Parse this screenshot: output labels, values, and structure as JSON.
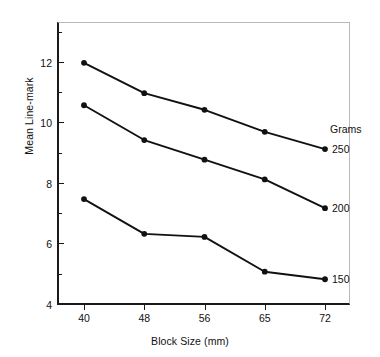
{
  "chart_data": {
    "type": "line",
    "title": "",
    "xlabel": "Block Size (mm)",
    "ylabel": "Mean Line-mark",
    "categories": [
      "40",
      "48",
      "56",
      "65",
      "72"
    ],
    "x_numeric": [
      40,
      48,
      56,
      65,
      72
    ],
    "xlim": [
      0,
      4
    ],
    "ylim": [
      4,
      13.35
    ],
    "grid": false,
    "legend_position": "right-inline",
    "legend_title": "Grams",
    "y_major_ticks": [
      "4",
      "6",
      "8",
      "10",
      "12"
    ],
    "y_minor_ticks": [
      "5",
      "7",
      "9",
      "11",
      "13"
    ],
    "series": [
      {
        "name": "250",
        "values": [
          12.0,
          11.0,
          10.45,
          9.72,
          9.15
        ]
      },
      {
        "name": "200",
        "values": [
          10.6,
          9.45,
          8.8,
          8.15,
          7.2
        ]
      },
      {
        "name": "150",
        "values": [
          7.5,
          6.35,
          6.25,
          5.1,
          4.85
        ]
      }
    ]
  },
  "axes": {
    "y_ticks_major": [
      {
        "label": "4",
        "value": 4
      },
      {
        "label": "6",
        "value": 6
      },
      {
        "label": "8",
        "value": 8
      },
      {
        "label": "10",
        "value": 10
      },
      {
        "label": "12",
        "value": 12
      }
    ],
    "y_ticks_minor": [
      {
        "value": 5
      },
      {
        "value": 7
      },
      {
        "value": 9
      },
      {
        "value": 11
      },
      {
        "value": 13
      }
    ],
    "x_ticks": [
      {
        "label": "40"
      },
      {
        "label": "48"
      },
      {
        "label": "56"
      },
      {
        "label": "65"
      },
      {
        "label": "72"
      }
    ]
  },
  "legend": {
    "title": "Grams",
    "entries": [
      {
        "label": "250"
      },
      {
        "label": "200"
      },
      {
        "label": "150"
      }
    ]
  },
  "style": {
    "line_color": "#111111",
    "marker_color": "#111111",
    "axis_color": "#1a1a1a",
    "frame_color": "#b9b9b9",
    "background": "#ffffff"
  }
}
